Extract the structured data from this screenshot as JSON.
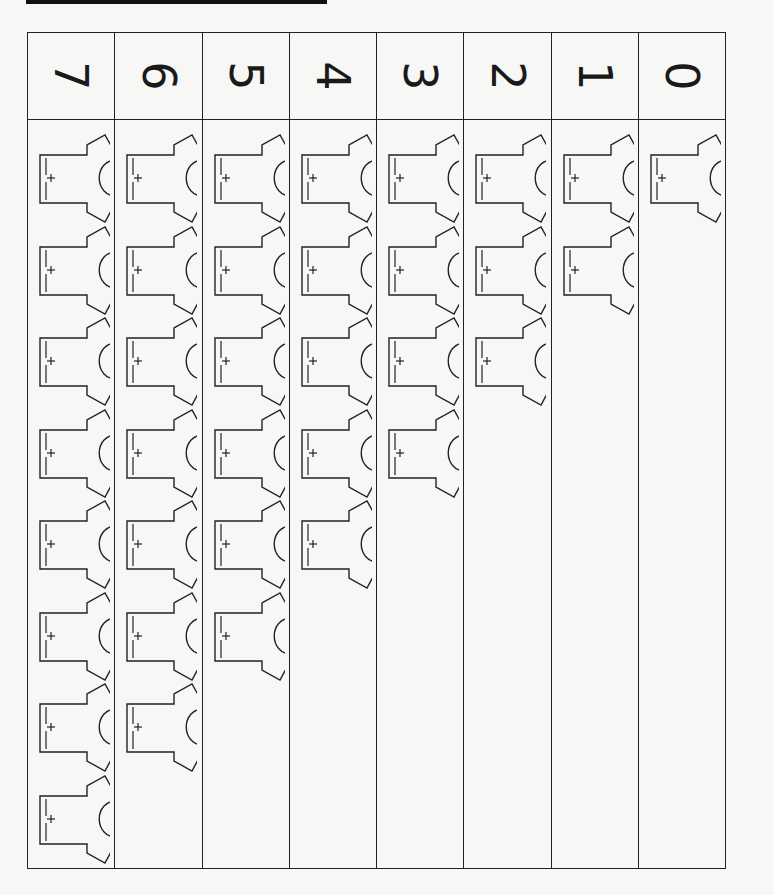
{
  "worksheet": {
    "title_bar": "",
    "orientation": "rotated-90",
    "columns": [
      {
        "number": "7",
        "shirt_count": 8
      },
      {
        "number": "6",
        "shirt_count": 7
      },
      {
        "number": "5",
        "shirt_count": 6
      },
      {
        "number": "4",
        "shirt_count": 5
      },
      {
        "number": "3",
        "shirt_count": 4
      },
      {
        "number": "2",
        "shirt_count": 3
      },
      {
        "number": "1",
        "shirt_count": 2
      },
      {
        "number": "0",
        "shirt_count": 1
      }
    ],
    "item_icon": "t-shirt-icon"
  },
  "colors": {
    "line": "#222222",
    "paper": "#f7f7f5",
    "bar": "#111111"
  }
}
